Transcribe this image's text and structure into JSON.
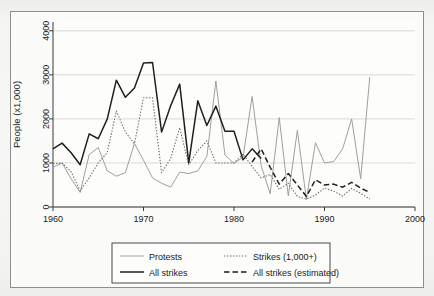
{
  "figure": {
    "top_caption": "",
    "background_color": "#f2f2f0",
    "plot_background": "#fbfbfa",
    "frame_color": "#8e8e8e"
  },
  "axes": {
    "y_title": "People (x1,000)",
    "y_ticks": [
      "0",
      "1000",
      "2000",
      "3000",
      "4000"
    ],
    "x_ticks": [
      "1960",
      "1970",
      "1980",
      "1990",
      "2000"
    ]
  },
  "legend": {
    "items": [
      {
        "label": "Protests",
        "style": "solid-thin",
        "color": "#9a9a9a"
      },
      {
        "label": "Strikes (1,000+)",
        "style": "dotted",
        "color": "#6d6d6d"
      },
      {
        "label": "All strikes",
        "style": "solid-thick",
        "color": "#1f1f1f"
      },
      {
        "label": "All strikes (estimated)",
        "style": "dashed",
        "color": "#1f1f1f"
      }
    ]
  },
  "chart_data": {
    "type": "line",
    "title": "",
    "xlabel": "",
    "ylabel": "People (x1,000)",
    "xlim": [
      1960,
      2000
    ],
    "ylim": [
      0,
      4200
    ],
    "y_gridlines": [
      0,
      1000,
      2000,
      3000,
      4000
    ],
    "grid": true,
    "legend_position": "below-plot",
    "series": [
      {
        "name": "Protests",
        "style": "solid-thin",
        "color": "#9a9a9a",
        "x": [
          1960,
          1961,
          1962,
          1963,
          1964,
          1965,
          1966,
          1967,
          1968,
          1969,
          1970,
          1971,
          1972,
          1973,
          1974,
          1975,
          1976,
          1977,
          1978,
          1979,
          1980,
          1981,
          1982,
          1983,
          1984,
          1985,
          1986,
          1987,
          1988,
          1989,
          1990,
          1991,
          1992,
          1993,
          1994,
          1995
        ],
        "y": [
          900,
          1000,
          640,
          330,
          1190,
          1350,
          820,
          700,
          780,
          1440,
          1060,
          660,
          540,
          450,
          790,
          760,
          820,
          1150,
          2860,
          1180,
          990,
          1130,
          2510,
          940,
          300,
          2030,
          250,
          1740,
          170,
          1460,
          1000,
          1030,
          1320,
          2000,
          640,
          2950
        ]
      },
      {
        "name": "Strikes (1,000+)",
        "style": "dotted",
        "color": "#6d6d6d",
        "x": [
          1960,
          1961,
          1962,
          1963,
          1964,
          1965,
          1966,
          1967,
          1968,
          1969,
          1970,
          1971,
          1972,
          1973,
          1974,
          1975,
          1976,
          1977,
          1978,
          1979,
          1980,
          1981,
          1982,
          1983,
          1984,
          1985,
          1986,
          1987,
          1988,
          1989,
          1990,
          1991,
          1992,
          1993,
          1994,
          1995
        ],
        "y": [
          980,
          1000,
          800,
          370,
          660,
          1000,
          1240,
          2180,
          1700,
          1440,
          2480,
          2480,
          780,
          1100,
          1800,
          960,
          1280,
          1500,
          1000,
          1000,
          1000,
          1200,
          920,
          660,
          740,
          400,
          540,
          240,
          180,
          270,
          430,
          360,
          250,
          420,
          310,
          180
        ]
      },
      {
        "name": "All strikes",
        "style": "solid-thick",
        "color": "#1f1f1f",
        "x": [
          1960,
          1961,
          1962,
          1963,
          1964,
          1965,
          1966,
          1967,
          1968,
          1969,
          1970,
          1971,
          1972,
          1973,
          1974,
          1975,
          1976,
          1977,
          1978,
          1979,
          1980,
          1981,
          1982,
          1983
        ],
        "y": [
          1320,
          1450,
          1230,
          960,
          1660,
          1550,
          2000,
          2880,
          2490,
          2700,
          3270,
          3280,
          1700,
          2300,
          2790,
          1000,
          2410,
          1850,
          2290,
          1720,
          1720,
          1070,
          1320,
          1100
        ]
      },
      {
        "name": "All strikes (estimated)",
        "style": "dashed",
        "color": "#1f1f1f",
        "x": [
          1982,
          1983,
          1984,
          1985,
          1986,
          1987,
          1988,
          1989,
          1990,
          1991,
          1992,
          1993,
          1994,
          1995
        ],
        "y": [
          1020,
          1320,
          900,
          520,
          760,
          500,
          240,
          620,
          500,
          520,
          450,
          560,
          430,
          330
        ]
      }
    ]
  }
}
